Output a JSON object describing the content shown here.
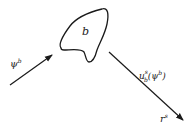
{
  "diagram": {
    "type": "scattering-schematic",
    "body": {
      "label": "b"
    },
    "incident": {
      "label_base": "ψ",
      "label_sup": "b"
    },
    "scattered": {
      "label_base": "u",
      "label_sub": "b",
      "label_sup": "s",
      "label_arg_base": "ψ",
      "label_arg_sup": "b"
    },
    "receiver": {
      "label_base": "r",
      "label_sup": "s"
    },
    "colors": {
      "stroke": "#1a1a1a",
      "text": "#222222",
      "background": "#ffffff"
    }
  }
}
